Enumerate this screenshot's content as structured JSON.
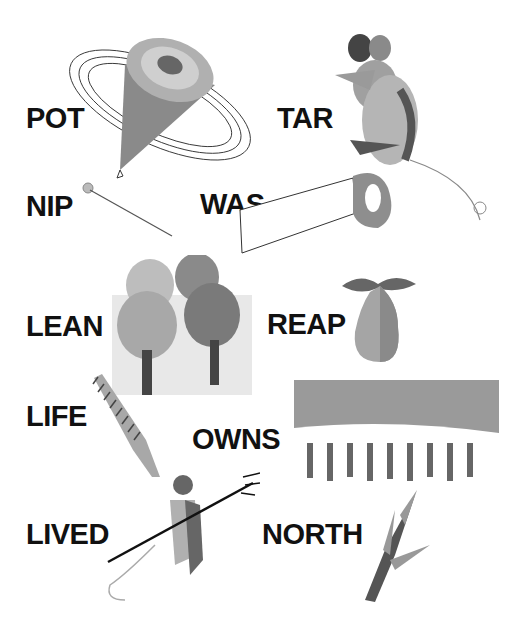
{
  "words": [
    {
      "text": "POT",
      "x": 26,
      "y": 104
    },
    {
      "text": "TAR",
      "x": 277,
      "y": 104
    },
    {
      "text": "NIP",
      "x": 26,
      "y": 192
    },
    {
      "text": "WAS",
      "x": 200,
      "y": 190
    },
    {
      "text": "LEAN",
      "x": 26,
      "y": 312
    },
    {
      "text": "REAP",
      "x": 267,
      "y": 310
    },
    {
      "text": "LIFE",
      "x": 26,
      "y": 402
    },
    {
      "text": "OWNS",
      "x": 192,
      "y": 425
    },
    {
      "text": "LIVED",
      "x": 26,
      "y": 520
    },
    {
      "text": "NORTH",
      "x": 262,
      "y": 520
    }
  ],
  "pictures": [
    "spinning-top",
    "mouse",
    "pin",
    "saw",
    "trees",
    "pear",
    "comb",
    "hedge-forest",
    "devil",
    "branch"
  ],
  "colors": {
    "ink": "#111111",
    "gray_light": "#c8c8c8",
    "gray_mid": "#9a9a9a",
    "gray_dark": "#555555"
  }
}
